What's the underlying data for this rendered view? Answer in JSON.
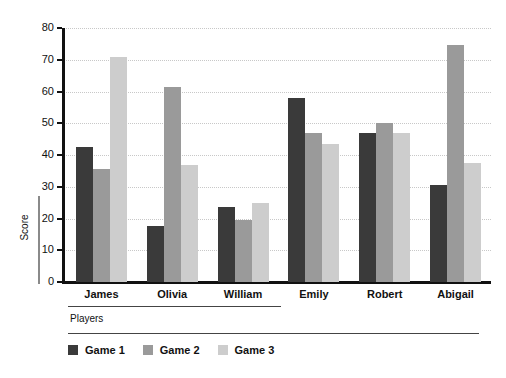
{
  "chart_data": {
    "type": "bar",
    "title": "",
    "xlabel": "Players",
    "ylabel": "Score",
    "categories": [
      "James",
      "Olivia",
      "William",
      "Emily",
      "Robert",
      "Abigail"
    ],
    "series": [
      {
        "name": "Game 1",
        "color": "#3a3a3a",
        "values": [
          42.5,
          17.5,
          23.5,
          58,
          47,
          30.5
        ]
      },
      {
        "name": "Game 2",
        "color": "#9a9a9a",
        "values": [
          35.5,
          61.5,
          19.5,
          47,
          50,
          74.5
        ]
      },
      {
        "name": "Game 3",
        "color": "#cdcdcd",
        "values": [
          71,
          37,
          25,
          43.5,
          47,
          37.5
        ]
      }
    ],
    "ylim": [
      0,
      80
    ],
    "yticks": [
      0,
      10,
      20,
      30,
      40,
      50,
      60,
      70,
      80
    ],
    "ytick_labels": [
      "0",
      "10",
      "20",
      "30",
      "40",
      "50",
      "60",
      "70",
      "80"
    ],
    "grid": true,
    "grid_axis": "y",
    "legend_position": "bottom-left",
    "background_color": "#ffffff",
    "axis_color": "#111111",
    "gridline_color": "#c8c8c8"
  }
}
